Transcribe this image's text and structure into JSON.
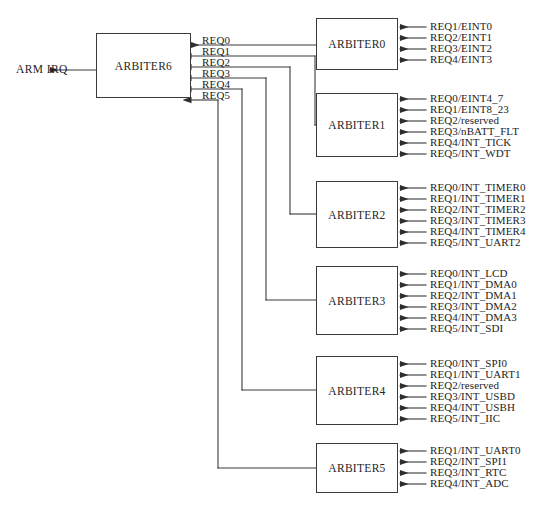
{
  "diagram": {
    "output_signal": "ARM IRQ",
    "main_arbiter": "ARBITER6",
    "req_lines": [
      "REQ0",
      "REQ1",
      "REQ2",
      "REQ3",
      "REQ4",
      "REQ5"
    ],
    "arbiters": [
      {
        "name": "ARBITER0",
        "inputs": [
          "REQ1/EINT0",
          "REQ2/EINT1",
          "REQ3/EINT2",
          "REQ4/EINT3"
        ]
      },
      {
        "name": "ARBITER1",
        "inputs": [
          "REQ0/EINT4_7",
          "REQ1/EINT8_23",
          "REQ2/reserved",
          "REQ3/nBATT_FLT",
          "REQ4/INT_TICK",
          "REQ5/INT_WDT"
        ]
      },
      {
        "name": "ARBITER2",
        "inputs": [
          "REQ0/INT_TIMER0",
          "REQ1/INT_TIMER1",
          "REQ2/INT_TIMER2",
          "REQ3/INT_TIMER3",
          "REQ4/INT_TIMER4",
          "REQ5/INT_UART2"
        ]
      },
      {
        "name": "ARBITER3",
        "inputs": [
          "REQ0/INT_LCD",
          "REQ1/INT_DMA0",
          "REQ2/INT_DMA1",
          "REQ3/INT_DMA2",
          "REQ4/INT_DMA3",
          "REQ5/INT_SDI"
        ]
      },
      {
        "name": "ARBITER4",
        "inputs": [
          "REQ0/INT_SPI0",
          "REQ1/INT_UART1",
          "REQ2/reserved",
          "REQ3/INT_USBD",
          "REQ4/INT_USBH",
          "REQ5/INT_IIC"
        ]
      },
      {
        "name": "ARBITER5",
        "inputs": [
          "REQ1/INT_UART0",
          "REQ2/INT_SPI1",
          "REQ3/INT_RTC",
          "REQ4/INT_ADC"
        ]
      }
    ],
    "colors": {
      "line": "#3a3a3a",
      "text": "#1d1d1d",
      "background": "#ffffff"
    }
  }
}
